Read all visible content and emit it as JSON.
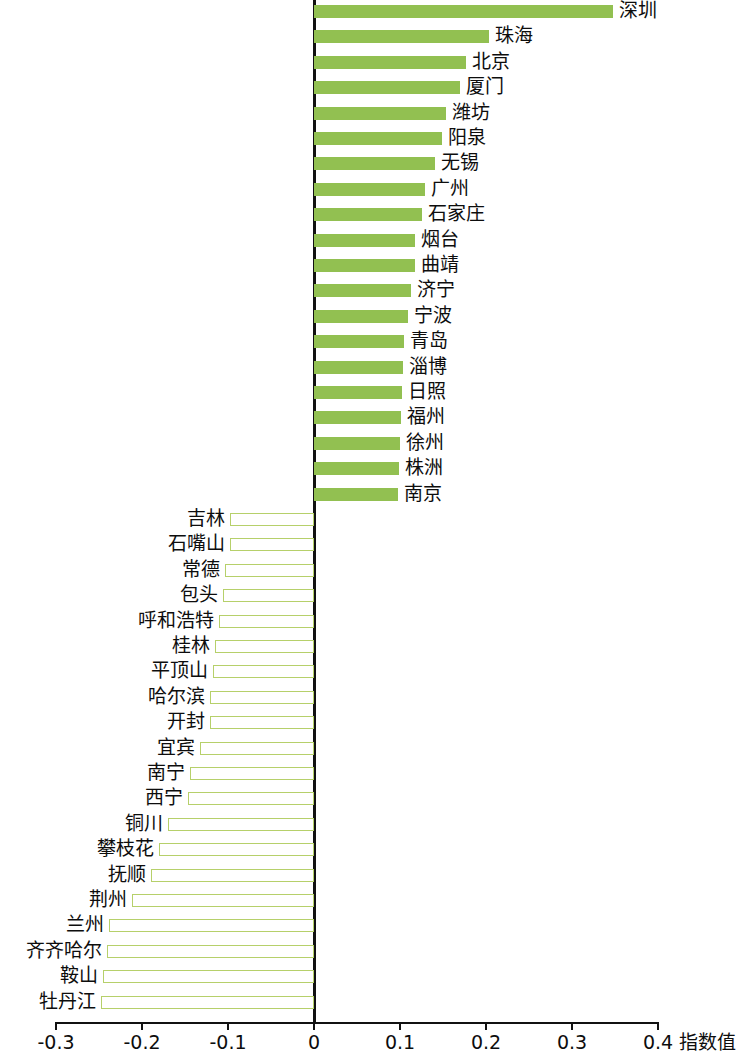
{
  "chart_data": {
    "type": "bar",
    "orientation": "horizontal",
    "title": "",
    "subtitle": "",
    "xlabel": "指数值",
    "ylabel": "",
    "xlim": [
      -0.3,
      0.4
    ],
    "xticks": [
      -0.3,
      -0.2,
      -0.1,
      0,
      0.1,
      0.2,
      0.3,
      0.4
    ],
    "xtick_labels": [
      "-0.3",
      "-0.2",
      "-0.1",
      "0",
      "0.1",
      "0.2",
      "0.3",
      "0.4"
    ],
    "grid": false,
    "legend": null,
    "colors": {
      "positive_fill": "#92c051",
      "negative_fill": "#ffffff",
      "negative_border": "#b6d06a",
      "axis": "#111111",
      "text": "#0d0d0d"
    },
    "categories": [
      "深圳",
      "珠海",
      "北京",
      "厦门",
      "潍坊",
      "阳泉",
      "无锡",
      "广州",
      "石家庄",
      "烟台",
      "曲靖",
      "济宁",
      "宁波",
      "青岛",
      "淄博",
      "日照",
      "福州",
      "徐州",
      "株洲",
      "南京",
      "吉林",
      "石嘴山",
      "常德",
      "包头",
      "呼和浩特",
      "桂林",
      "平顶山",
      "哈尔滨",
      "开封",
      "宜宾",
      "南宁",
      "西宁",
      "铜川",
      "攀枝花",
      "抚顺",
      "荆州",
      "兰州",
      "齐齐哈尔",
      "鞍山",
      "牡丹江"
    ],
    "values": [
      0.348,
      0.203,
      0.177,
      0.17,
      0.153,
      0.149,
      0.141,
      0.129,
      0.126,
      0.117,
      0.117,
      0.113,
      0.109,
      0.105,
      0.103,
      0.102,
      0.101,
      0.1,
      0.099,
      0.098,
      -0.098,
      -0.098,
      -0.104,
      -0.106,
      -0.11,
      -0.115,
      -0.118,
      -0.121,
      -0.121,
      -0.133,
      -0.144,
      -0.147,
      -0.17,
      -0.18,
      -0.189,
      -0.212,
      -0.238,
      -0.241,
      -0.245,
      -0.248
    ]
  }
}
